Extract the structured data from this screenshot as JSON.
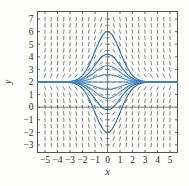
{
  "figure": {
    "name": "slope-field-plot",
    "background": "#fdfdfc"
  },
  "chart_data": {
    "type": "line",
    "title": "",
    "subtitle": "",
    "xlabel": "x",
    "ylabel": "y",
    "xlim": [
      -5.6,
      5.6
    ],
    "ylim": [
      -3.6,
      7.6
    ],
    "grid": false,
    "legend": null,
    "xticks": [
      -5,
      -4,
      -3,
      -2,
      -1,
      0,
      1,
      2,
      3,
      4,
      5
    ],
    "xticklabels": [
      "−5",
      "−4",
      "−3",
      "−2",
      "−1",
      "0",
      "1",
      "2",
      "3",
      "4",
      "5"
    ],
    "yticks": [
      -3,
      -2,
      -1,
      0,
      1,
      2,
      3,
      4,
      5,
      6,
      7
    ],
    "yticklabels": [
      "−3",
      "−2",
      "−1",
      "0",
      "1",
      "2",
      "3",
      "4",
      "5",
      "6",
      "7"
    ],
    "equilibrium_line": 2,
    "frame_color": "#55544f",
    "axis_color": "#6e6d68",
    "tick_color": "#55544f",
    "field_color": "#6b6a66",
    "curve_color": "#4f8fc4",
    "curve_color_dark": "#2f6fae",
    "field": {
      "description": "direction field of dy/dx = -x*(y-2)",
      "x_start": -5.0,
      "x_step": 0.5,
      "x_count": 21,
      "y_start": -3.0,
      "y_step": 0.5,
      "y_count": 21,
      "segment_length": 0.42
    },
    "series": [
      {
        "name": "solution-c-0.6",
        "c": 0.6
      },
      {
        "name": "solution-c-1.3",
        "c": 1.3
      },
      {
        "name": "solution-c-2.2",
        "c": 2.2
      },
      {
        "name": "solution-c-4.0",
        "c": 4.0
      },
      {
        "name": "solution-c-neg-0.6",
        "c": -0.6
      },
      {
        "name": "solution-c-neg-1.3",
        "c": -1.3
      },
      {
        "name": "solution-c-neg-2.2",
        "c": -2.2
      },
      {
        "name": "solution-c-neg-4.0",
        "c": -4.0
      },
      {
        "name": "equilibrium-y-2",
        "c": 0.0
      }
    ]
  }
}
